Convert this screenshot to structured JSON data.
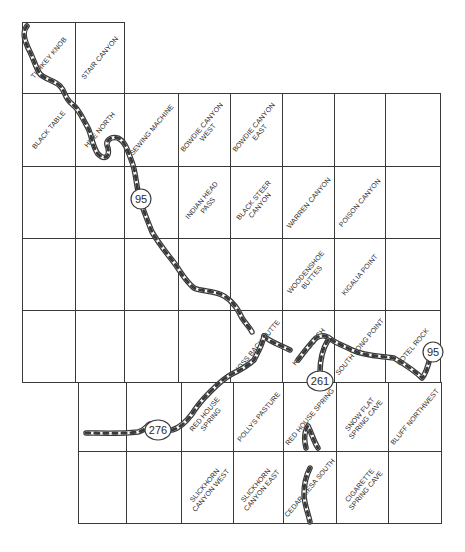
{
  "map": {
    "type": "quadrangle-index-map",
    "quads": [
      {
        "name": "TURKEY KNOB",
        "row": 0,
        "col": 0
      },
      {
        "name": "STAIR CANYON",
        "row": 0,
        "col": 1
      },
      {
        "name": "BLACK TABLE",
        "row": 1,
        "col": 0
      },
      {
        "name": "HITE NORTH",
        "row": 1,
        "col": 1
      },
      {
        "name": "SEWING MACHINE",
        "row": 1,
        "col": 2
      },
      {
        "name": "BOWDIE CANYON\nWEST",
        "row": 1,
        "col": 3
      },
      {
        "name": "BOWDIE CANYON\nEAST",
        "row": 1,
        "col": 4
      },
      {
        "name": "",
        "row": 1,
        "col": 5
      },
      {
        "name": "",
        "row": 1,
        "col": 6
      },
      {
        "name": "",
        "row": 1,
        "col": 7
      },
      {
        "name": "",
        "row": 2,
        "col": 0
      },
      {
        "name": "",
        "row": 2,
        "col": 1
      },
      {
        "name": "",
        "row": 2,
        "col": 2
      },
      {
        "name": "INDIAN HEAD\nPASS",
        "row": 2,
        "col": 3
      },
      {
        "name": "BLACK STEER\nCANYON",
        "row": 2,
        "col": 4
      },
      {
        "name": "WARREN CANYON",
        "row": 2,
        "col": 5
      },
      {
        "name": "POISON CANYON",
        "row": 2,
        "col": 6
      },
      {
        "name": "",
        "row": 2,
        "col": 7
      },
      {
        "name": "",
        "row": 3,
        "col": 0
      },
      {
        "name": "",
        "row": 3,
        "col": 1
      },
      {
        "name": "",
        "row": 3,
        "col": 2
      },
      {
        "name": "",
        "row": 3,
        "col": 3
      },
      {
        "name": "",
        "row": 3,
        "col": 4
      },
      {
        "name": "WOODENSHOE\nBUTTES",
        "row": 3,
        "col": 5
      },
      {
        "name": "KIGALIA POINT",
        "row": 3,
        "col": 6
      },
      {
        "name": "",
        "row": 3,
        "col": 7
      },
      {
        "name": "",
        "row": 4,
        "col": 0
      },
      {
        "name": "",
        "row": 4,
        "col": 1
      },
      {
        "name": "",
        "row": 4,
        "col": 2
      },
      {
        "name": "",
        "row": 4,
        "col": 3
      },
      {
        "name": "MOSS BACK BUTTE",
        "row": 4,
        "col": 4
      },
      {
        "name": "KANE GULCH",
        "row": 4,
        "col": 5
      },
      {
        "name": "SOUTH LONG POINT",
        "row": 4,
        "col": 6
      },
      {
        "name": "HOTEL ROCK",
        "row": 4,
        "col": 7
      },
      {
        "name": "",
        "row": 5,
        "col": 0
      },
      {
        "name": "",
        "row": 5,
        "col": 1
      },
      {
        "name": "RED HOUSE\nSPRING",
        "row": 5,
        "col": 2
      },
      {
        "name": "POLLYS PASTURE",
        "row": 5,
        "col": 3
      },
      {
        "name": "RED HOUSE SPRING",
        "row": 5,
        "col": 4
      },
      {
        "name": "SNOW FLAT\nSPRING CAVE",
        "row": 5,
        "col": 5
      },
      {
        "name": "BLUFF NORTHWEST",
        "row": 5,
        "col": 6
      },
      {
        "name": "",
        "row": 6,
        "col": 0
      },
      {
        "name": "",
        "row": 6,
        "col": 1
      },
      {
        "name": "SLICKHORN\nCANYON WEST",
        "row": 6,
        "col": 2
      },
      {
        "name": "SLICKHORN\nCANYON EAST",
        "row": 6,
        "col": 3
      },
      {
        "name": "CEDAR MESA SOUTH",
        "row": 6,
        "col": 4
      },
      {
        "name": "CIGARETTE\nSPRING CAVE",
        "row": 6,
        "col": 5
      },
      {
        "name": "",
        "row": 6,
        "col": 6
      }
    ],
    "highway_shields": [
      {
        "label": "95",
        "x": 141,
        "y": 199
      },
      {
        "label": "95",
        "x": 433,
        "y": 352
      },
      {
        "label": "261",
        "x": 320,
        "y": 381
      },
      {
        "label": "276",
        "x": 158,
        "y": 430
      }
    ],
    "colors": {
      "grid": "#3a3a3a",
      "road_outline": "#3a3a3a",
      "road_fill": "#ffffff",
      "road_dash": "#3a3a3a",
      "text": "#2a2a2a"
    }
  }
}
